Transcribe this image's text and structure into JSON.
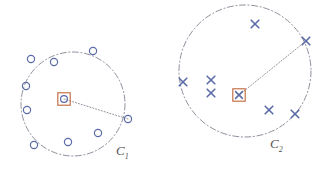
{
  "figure": {
    "title": "",
    "background_color": "#ffffff",
    "marker_color": "#5b6ba8",
    "center_box_color": "#c0663a",
    "boundary_color": "#5a5a6e",
    "radius_line_color": "#6a6a7a"
  },
  "chart_data": {
    "type": "scatter",
    "title": "",
    "xlabel": "",
    "ylabel": "",
    "xlim": [
      0,
      322
    ],
    "ylim": [
      170,
      0
    ],
    "grid": false,
    "legend": "none",
    "annotations": [
      {
        "text": "C",
        "subscript": "1",
        "x": 116,
        "y": 144
      },
      {
        "text": "C",
        "subscript": "2",
        "x": 270,
        "y": 137
      }
    ],
    "clusters": [
      {
        "name": "C1",
        "label": "C",
        "label_subscript": "1",
        "marker": "circle",
        "boundary": {
          "cx": 73,
          "cy": 104,
          "r": 52,
          "style": "dashdot"
        },
        "centroid": {
          "x": 64,
          "y": 99,
          "marker": "circle-in-square"
        },
        "radius_endpoint": {
          "x": 128,
          "y": 119
        },
        "points": [
          {
            "x": 31,
            "y": 59
          },
          {
            "x": 54,
            "y": 62
          },
          {
            "x": 93,
            "y": 51
          },
          {
            "x": 26,
            "y": 86
          },
          {
            "x": 27,
            "y": 110
          },
          {
            "x": 128,
            "y": 119
          },
          {
            "x": 98,
            "y": 133
          },
          {
            "x": 68,
            "y": 142
          },
          {
            "x": 34,
            "y": 145
          }
        ],
        "point_count": 9
      },
      {
        "name": "C2",
        "label": "C",
        "label_subscript": "2",
        "marker": "cross",
        "boundary": {
          "cx": 245,
          "cy": 71,
          "r": 66,
          "style": "dashdot"
        },
        "centroid": {
          "x": 239,
          "y": 95,
          "marker": "cross-in-square"
        },
        "radius_endpoint": {
          "x": 306,
          "y": 41
        },
        "points": [
          {
            "x": 255,
            "y": 24
          },
          {
            "x": 306,
            "y": 41
          },
          {
            "x": 183,
            "y": 82
          },
          {
            "x": 211,
            "y": 80
          },
          {
            "x": 211,
            "y": 93
          },
          {
            "x": 269,
            "y": 110
          },
          {
            "x": 295,
            "y": 114
          }
        ],
        "point_count": 7
      }
    ]
  }
}
